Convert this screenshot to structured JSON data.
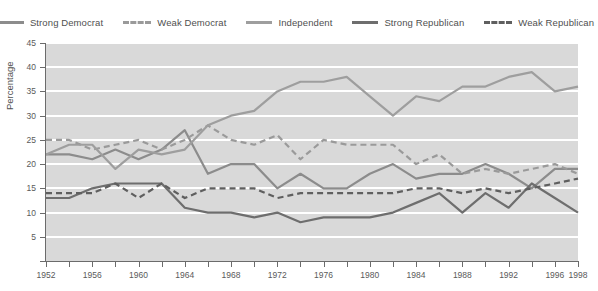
{
  "chart_data": {
    "type": "line",
    "title": "",
    "xlabel": "",
    "ylabel": "Percentage",
    "xlim": [
      1952,
      1998
    ],
    "ylim": [
      0,
      45
    ],
    "ytick_values": [
      0,
      5,
      10,
      15,
      20,
      25,
      30,
      35,
      40,
      45
    ],
    "ytick_labels": [
      "",
      "5",
      "10",
      "15",
      "20",
      "25",
      "30",
      "35",
      "40",
      "45"
    ],
    "x": [
      1952,
      1954,
      1956,
      1958,
      1960,
      1962,
      1964,
      1966,
      1968,
      1970,
      1972,
      1974,
      1976,
      1978,
      1980,
      1982,
      1984,
      1986,
      1988,
      1990,
      1992,
      1994,
      1996,
      1998
    ],
    "xtick_labels": [
      "1952",
      "1956",
      "1960",
      "1964",
      "1968",
      "1972",
      "1976",
      "1980",
      "1984",
      "1988",
      "1992",
      "1996",
      "1998"
    ],
    "xtick_years": [
      1952,
      1956,
      1960,
      1964,
      1968,
      1972,
      1976,
      1980,
      1984,
      1988,
      1992,
      1996,
      1998
    ],
    "grid": true,
    "grid_color": "#ffffff",
    "plot_background": "#d9d9d9",
    "legend_position": "top",
    "series": [
      {
        "name": "Strong Democrat",
        "style": "solid",
        "color": "#8c8c8c",
        "width": 2.2,
        "values": [
          22,
          22,
          21,
          23,
          21,
          23,
          27,
          18,
          20,
          20,
          15,
          18,
          15,
          15,
          18,
          20,
          17,
          18,
          18,
          20,
          18,
          15,
          19,
          19
        ]
      },
      {
        "name": "Weak Democrat",
        "style": "dashed",
        "color": "#9a9a9a",
        "width": 2.2,
        "values": [
          25,
          25,
          23,
          24,
          25,
          23,
          25,
          28,
          25,
          24,
          26,
          21,
          25,
          24,
          24,
          24,
          20,
          22,
          18,
          19,
          18,
          19,
          20,
          18
        ]
      },
      {
        "name": "Independent",
        "style": "solid",
        "color": "#9e9e9e",
        "width": 2.2,
        "values": [
          22,
          24,
          24,
          19,
          23,
          22,
          23,
          28,
          30,
          31,
          35,
          37,
          37,
          38,
          34,
          30,
          34,
          33,
          36,
          36,
          38,
          39,
          35,
          36
        ]
      },
      {
        "name": "Strong Republican",
        "style": "solid",
        "color": "#6e6e6e",
        "width": 2.2,
        "values": [
          13,
          13,
          15,
          16,
          16,
          16,
          11,
          10,
          10,
          9,
          10,
          8,
          9,
          9,
          9,
          10,
          12,
          14,
          10,
          14,
          11,
          16,
          13,
          10
        ]
      },
      {
        "name": "Weak Republican",
        "style": "dashed",
        "color": "#5f5f5f",
        "width": 2.2,
        "values": [
          14,
          14,
          14,
          16,
          13,
          16,
          13,
          15,
          15,
          15,
          13,
          14,
          14,
          14,
          14,
          14,
          15,
          15,
          14,
          15,
          14,
          15,
          16,
          17
        ]
      }
    ]
  },
  "legend": {
    "items": [
      {
        "label": "Strong Democrat"
      },
      {
        "label": "Weak Democrat"
      },
      {
        "label": "Independent"
      },
      {
        "label": "Strong Republican"
      },
      {
        "label": "Weak Republican"
      }
    ]
  }
}
